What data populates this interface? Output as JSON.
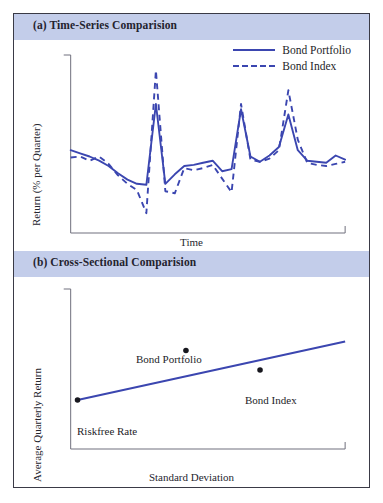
{
  "figure": {
    "panels": [
      {
        "id": "a",
        "band_label": "(a) Time-Series Comparision",
        "xlabel": "Time",
        "ylabel": "Return (% per Quarter)",
        "legend": [
          {
            "label": "Bond Portfolio",
            "style": "solid"
          },
          {
            "label": "Bond Index",
            "style": "dashed"
          }
        ]
      },
      {
        "id": "b",
        "band_label": "(b) Cross-Sectional Comparision",
        "xlabel": "Standard Deviation",
        "ylabel": "Average Quarterly Return",
        "points": [
          {
            "label": "Riskfree Rate"
          },
          {
            "label": "Bond Portfolio"
          },
          {
            "label": "Bond Index"
          }
        ]
      }
    ]
  },
  "colors": {
    "band": "#c3cdea",
    "series_line": "#3b46b0",
    "axis": "#6e6e7c",
    "frame": "#3a3a46",
    "point": "#17171e"
  },
  "chart_data": [
    {
      "type": "line",
      "title": "(a) Time-Series Comparision",
      "xlabel": "Time",
      "ylabel": "Return (% per Quarter)",
      "grid": false,
      "legend_position": "top-right",
      "xlim": [
        0,
        29
      ],
      "ylim": [
        -6,
        10
      ],
      "x": [
        0,
        1,
        2,
        3,
        4,
        5,
        6,
        7,
        8,
        9,
        10,
        11,
        12,
        13,
        14,
        15,
        16,
        17,
        18,
        19,
        20,
        21,
        22,
        23,
        24,
        25,
        26,
        27,
        28,
        29
      ],
      "series": [
        {
          "name": "Bond Portfolio",
          "style": "solid",
          "values": [
            1.6,
            1.3,
            1.0,
            0.6,
            0.1,
            -0.6,
            -1.2,
            -1.6,
            -1.7,
            6.0,
            -1.6,
            -0.7,
            0.1,
            0.2,
            0.4,
            0.6,
            -0.4,
            -0.2,
            5.5,
            1.0,
            0.5,
            1.1,
            1.9,
            5.0,
            1.6,
            0.6,
            0.5,
            0.4,
            1.1,
            0.7
          ]
        },
        {
          "name": "Bond Index",
          "style": "dashed",
          "values": [
            0.9,
            1.0,
            0.6,
            1.0,
            0.3,
            -0.8,
            -1.6,
            -2.2,
            -4.4,
            9.2,
            -2.3,
            -2.5,
            -0.1,
            -0.3,
            -0.1,
            0.2,
            -1.1,
            -2.4,
            6.0,
            0.7,
            0.5,
            0.8,
            1.6,
            7.3,
            2.6,
            0.4,
            0.2,
            0.1,
            0.3,
            0.5
          ]
        }
      ]
    },
    {
      "type": "scatter",
      "title": "(b) Cross-Sectional Comparision",
      "xlabel": "Standard Deviation",
      "ylabel": "Average Quarterly Return",
      "grid": false,
      "xlim": [
        0,
        10
      ],
      "ylim": [
        0,
        10
      ],
      "points": [
        {
          "label": "Riskfree Rate",
          "x": 0.25,
          "y": 3.0
        },
        {
          "label": "Bond Portfolio",
          "x": 4.2,
          "y": 6.3
        },
        {
          "label": "Bond Index",
          "x": 6.9,
          "y": 5.0
        }
      ],
      "fit_line": {
        "name": "Security Market Line",
        "x": [
          0.25,
          10.0
        ],
        "y": [
          3.0,
          6.9
        ]
      }
    }
  ]
}
